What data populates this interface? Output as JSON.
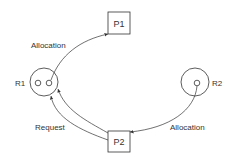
{
  "diagram": {
    "nodes": {
      "p1": {
        "label": "P1",
        "type": "process"
      },
      "p2": {
        "label": "P2",
        "type": "process"
      },
      "r1": {
        "label": "R1",
        "type": "resource",
        "instances": 2
      },
      "r2": {
        "label": "R2",
        "type": "resource",
        "instances": 1
      }
    },
    "edges": [
      {
        "from": "R1",
        "to": "P1",
        "label": "Allocation"
      },
      {
        "from": "P2",
        "to": "R1",
        "label": "Request"
      },
      {
        "from": "R2",
        "to": "P2",
        "label": "Allocation"
      }
    ],
    "colors": {
      "stroke": "#333333",
      "background": "#ffffff"
    }
  }
}
